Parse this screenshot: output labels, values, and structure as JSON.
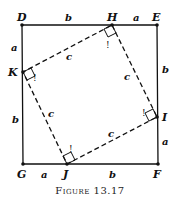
{
  "figure": {
    "caption": "Figure 13.17",
    "points": {
      "D": "D",
      "E": "E",
      "F": "F",
      "G": "G",
      "H": "H",
      "I": "I",
      "J": "J",
      "K": "K"
    },
    "segment_labels": {
      "DH": "b",
      "HE": "a",
      "EI": "b",
      "IF": "a",
      "FJ": "b",
      "JG": "a",
      "GK": "b",
      "KD": "a",
      "HI": "c",
      "IJ": "c",
      "JK": "c",
      "KH": "c"
    },
    "right_angle_marker": "!",
    "outer_square": "DEFG",
    "inner_square": "HIJK"
  }
}
